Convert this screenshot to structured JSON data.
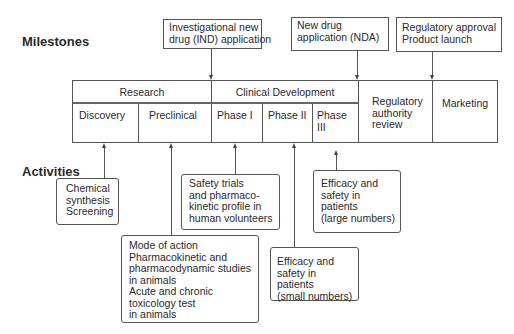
{
  "labels": {
    "milestones": "Milestones",
    "activities": "Activities"
  },
  "milestones": [
    {
      "lines": [
        "Investigational new",
        "drug (IND) application"
      ],
      "points_to": "Clinical Development start"
    },
    {
      "lines": [
        "New drug",
        "application (NDA)"
      ],
      "points_to": "Regulatory authority review start"
    },
    {
      "lines": [
        "Regulatory approval",
        "Product launch"
      ],
      "points_to": "Marketing start"
    }
  ],
  "stages": {
    "top": [
      {
        "label": "Research"
      },
      {
        "label": "Clinical Development"
      }
    ],
    "bottom": [
      {
        "label": "Discovery"
      },
      {
        "label": "Preclinical"
      },
      {
        "label": "Phase I"
      },
      {
        "label": "Phase II"
      },
      {
        "label": "Phase III"
      }
    ],
    "regulatory": {
      "lines": [
        "Regulatory",
        "authority",
        "review"
      ]
    },
    "marketing": {
      "label": "Marketing"
    }
  },
  "activities": [
    {
      "stage": "Discovery",
      "lines": [
        "Chemical",
        "synthesis",
        "Screening"
      ]
    },
    {
      "stage": "Preclinical",
      "lines": [
        "Mode of action",
        "Pharmacokinetic and",
        "pharmacodynamic studies",
        "in animals",
        "Acute and chronic",
        "toxicology test",
        "in animals"
      ]
    },
    {
      "stage": "Phase I",
      "lines": [
        "Safety trials",
        "and pharmaco-",
        "kinetic profile in",
        "human volunteers"
      ]
    },
    {
      "stage": "Phase II",
      "lines": [
        "Efficacy and",
        "safety in",
        "patients",
        "(small numbers)"
      ]
    },
    {
      "stage": "Phase III",
      "lines": [
        "Efficacy and",
        "safety in",
        "patients",
        "(large numbers)"
      ]
    }
  ]
}
